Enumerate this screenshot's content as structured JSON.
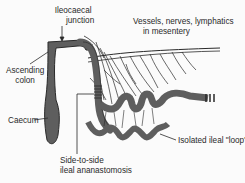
{
  "diagram": {
    "type": "anatomical illustration",
    "colors": {
      "ink": "#2a2a2a",
      "bowel_fill": "#6b6b6b",
      "bowel_dark": "#3a3a3a",
      "background": "#fbfbfb"
    },
    "labels": {
      "ileocaecal_line1": "Ileocaecal",
      "ileocaecal_line2": "junction",
      "vessels_line1": "Vessels, nerves, lymphatics",
      "vessels_line2": "in mesentery",
      "ascending_line1": "Ascending",
      "ascending_line2": "colon",
      "caecum": "Caecum",
      "anastomosis_line1": "Side-to-side",
      "anastomosis_line2": "ileal ananastomosis",
      "isolated_loop": "Isolated ileal \"loop\""
    }
  }
}
